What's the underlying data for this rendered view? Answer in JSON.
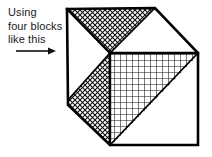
{
  "figure": {
    "title": "Using four blocks like this",
    "background_color": "#ffffff",
    "line_color": "#000000",
    "caption": {
      "lines": [
        "Using",
        "four blocks",
        "like this"
      ],
      "line_1": "Using",
      "line_2": "four blocks",
      "line_3": "like this"
    },
    "arrow": {
      "name": "right-arrow",
      "direction": "right",
      "label": ""
    },
    "shape": {
      "name": "cube",
      "projection": "isometric",
      "faces": [
        {
          "name": "top-face",
          "regions": [
            {
              "name": "top-left-triangle",
              "fill": "diagonal-crosshatch"
            },
            {
              "name": "top-right-triangle",
              "fill": "white"
            }
          ]
        },
        {
          "name": "left-face",
          "regions": [
            {
              "name": "left-upper-triangle",
              "fill": "white"
            },
            {
              "name": "left-lower-band",
              "fill": "diagonal-crosshatch"
            }
          ]
        },
        {
          "name": "front-face",
          "regions": [
            {
              "name": "front-upper-triangle",
              "fill": "square-grid"
            },
            {
              "name": "front-lower-triangle",
              "fill": "white"
            }
          ]
        }
      ]
    }
  }
}
